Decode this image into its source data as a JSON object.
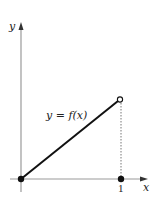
{
  "diagram": {
    "axis_labels": {
      "x": "x",
      "y": "y"
    },
    "function_label": "y = f(x)",
    "tick_labels": [
      "1"
    ],
    "points": {
      "origin": {
        "x": 0,
        "y": 0,
        "style": "closed"
      },
      "endpoint": {
        "x": 1,
        "style": "open"
      },
      "x_one": {
        "x": 1,
        "y": 0,
        "style": "closed"
      }
    },
    "colors": {
      "axis": "#999999",
      "line": "#111111",
      "dotted": "#777777"
    }
  }
}
